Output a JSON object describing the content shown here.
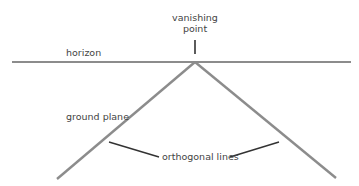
{
  "diagram": {
    "labels": {
      "vanishing_point_line1": "vanishing",
      "vanishing_point_line2": "point",
      "horizon": "horizon",
      "ground_plane": "ground plane",
      "orthogonal_lines": "orthogonal lines"
    },
    "colors": {
      "line": "#8a8a8a",
      "pointer": "#333333",
      "text": "#444444"
    }
  }
}
